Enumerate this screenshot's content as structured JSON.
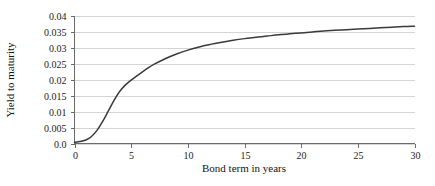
{
  "chart_data": {
    "type": "line",
    "title": "",
    "subtitle": "",
    "xlabel": "Bond term in years",
    "ylabel": "Yield to maturity",
    "xlim": [
      0,
      30
    ],
    "ylim": [
      0,
      0.04
    ],
    "grid": "horizontal",
    "legend": "none",
    "xticks": [
      0,
      5,
      10,
      15,
      20,
      25,
      30
    ],
    "xtick_labels": [
      "0",
      "5",
      "10",
      "15",
      "20",
      "25",
      "30"
    ],
    "yticks": [
      0,
      0.005,
      0.01,
      0.015,
      0.02,
      0.025,
      0.03,
      0.035,
      0.04
    ],
    "ytick_labels": [
      "0.0",
      "0.005",
      "0.01",
      "0.015",
      "0.02",
      "0.025",
      "0.03",
      "0.035",
      "0.04"
    ],
    "series": [
      {
        "name": "Yield curve",
        "color": "#3a3a3a",
        "x": [
          0,
          0.5,
          1,
          1.5,
          2,
          2.5,
          3,
          3.5,
          4,
          4.5,
          5,
          6,
          7,
          8,
          9,
          10,
          11,
          12,
          13,
          14,
          15,
          16,
          17,
          18,
          19,
          20,
          21,
          22,
          23,
          24,
          25,
          26,
          27,
          28,
          29,
          30
        ],
        "values": [
          0.0004,
          0.0006,
          0.0011,
          0.0022,
          0.0042,
          0.007,
          0.0103,
          0.0136,
          0.0164,
          0.0184,
          0.0199,
          0.0225,
          0.0248,
          0.0266,
          0.0281,
          0.0293,
          0.0303,
          0.0311,
          0.0318,
          0.0324,
          0.0329,
          0.0333,
          0.0337,
          0.0341,
          0.0344,
          0.0347,
          0.035,
          0.0353,
          0.0355,
          0.0357,
          0.0359,
          0.0361,
          0.0363,
          0.0365,
          0.0367,
          0.0368
        ]
      }
    ],
    "colors": {
      "line": "#3a3a3a",
      "gridline": "#c9c9c9",
      "axis": "#6b6b6b",
      "text": "#1c1c1c",
      "background": "#ffffff"
    }
  }
}
